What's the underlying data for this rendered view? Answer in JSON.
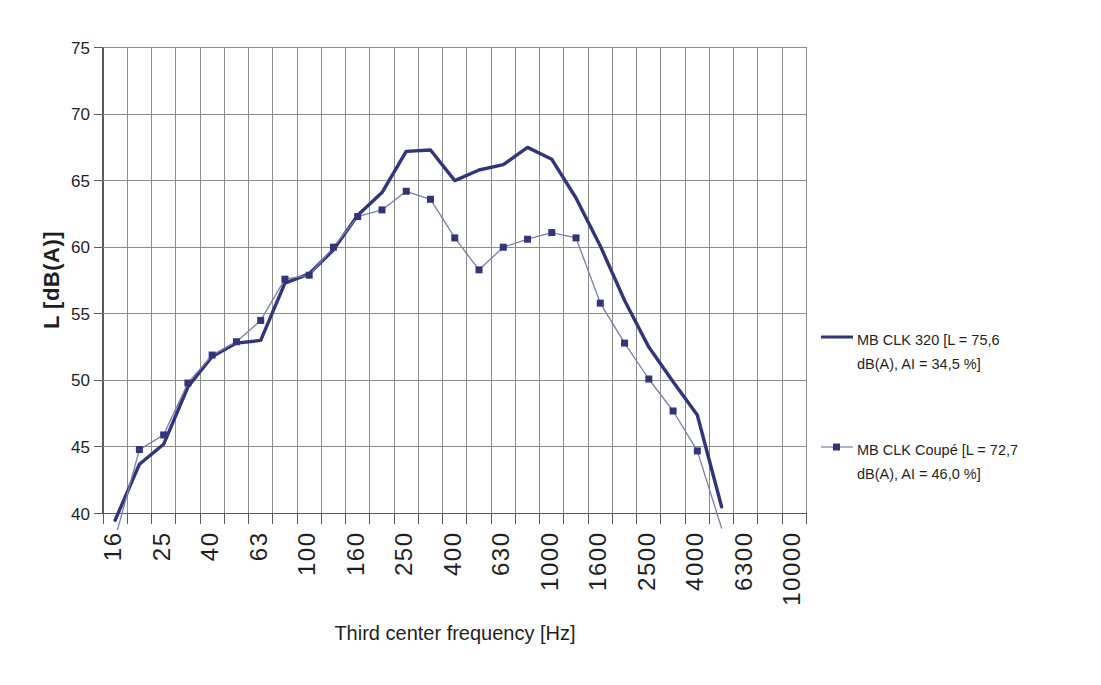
{
  "chart_data": {
    "type": "line",
    "title": "",
    "xlabel": "Third center frequency [Hz]",
    "ylabel": "L [dB(A)]",
    "x_scale": "third-octave-band categories",
    "ylim": [
      40,
      75
    ],
    "y_ticks": [
      40,
      45,
      50,
      55,
      60,
      65,
      70,
      75
    ],
    "categories": [
      "16",
      "20",
      "25",
      "31.5",
      "40",
      "50",
      "63",
      "80",
      "100",
      "125",
      "160",
      "200",
      "250",
      "315",
      "400",
      "500",
      "630",
      "800",
      "1000",
      "1250",
      "1600",
      "2000",
      "2500",
      "3150",
      "4000",
      "5000",
      "6300",
      "8000",
      "10000"
    ],
    "x_tick_labels": [
      "16",
      "25",
      "40",
      "63",
      "100",
      "160",
      "250",
      "400",
      "630",
      "1000",
      "1600",
      "2500",
      "4000",
      "6300",
      "10000"
    ],
    "grid": "both",
    "legend_position": "right",
    "background_color": "#ffffff",
    "grid_color": "#8c8c8c",
    "axis_color": "#595959",
    "text_color": "#1f1f1f",
    "series": [
      {
        "name": "MB CLK 320 [L = 75,6 dB(A), AI = 34,5 %]",
        "line_style": "solid-thick",
        "marker": "none",
        "color": "#32347c",
        "line_width": 3.4,
        "values": [
          39.5,
          43.7,
          45.2,
          49.5,
          51.8,
          52.8,
          53.0,
          57.3,
          58.0,
          59.8,
          62.4,
          64.1,
          67.2,
          67.3,
          65.0,
          65.8,
          66.2,
          67.5,
          66.6,
          63.7,
          60.1,
          56.0,
          52.5,
          49.9,
          47.4,
          40.5,
          null,
          null,
          null
        ]
      },
      {
        "name": "MB CLK Coupé [L = 72,7 dB(A), AI = 46,0 %]",
        "line_style": "solid-thin",
        "marker": "square",
        "color": "#7b7ea8",
        "marker_color": "#32347c",
        "line_width": 1.3,
        "values": [
          38.1,
          44.8,
          45.9,
          49.8,
          51.9,
          52.9,
          54.5,
          57.6,
          57.9,
          60.0,
          62.3,
          62.8,
          64.2,
          63.6,
          60.7,
          58.3,
          60.0,
          60.6,
          61.1,
          60.7,
          55.8,
          52.8,
          50.1,
          47.7,
          44.7,
          38.9,
          null,
          null,
          null
        ]
      }
    ]
  }
}
